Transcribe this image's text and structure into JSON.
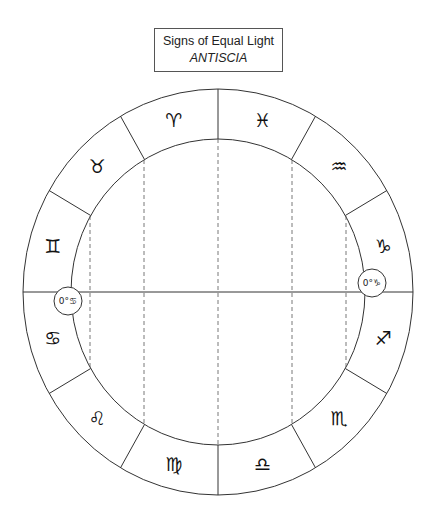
{
  "title": {
    "main": "Signs of Equal Light",
    "sub": "ANTISCIA"
  },
  "wheel": {
    "center": [
      218,
      292
    ],
    "outer_radius": [
      195,
      203
    ],
    "inner_radius": [
      147,
      153
    ],
    "signs": [
      {
        "name": "aries",
        "glyph": "♈︎",
        "angle": 105
      },
      {
        "name": "pisces",
        "glyph": "♓︎",
        "angle": 75
      },
      {
        "name": "aquarius",
        "glyph": "♒︎",
        "angle": 45
      },
      {
        "name": "capricorn",
        "glyph": "♑︎",
        "angle": 15
      },
      {
        "name": "sagittarius",
        "glyph": "♐︎",
        "angle": -15
      },
      {
        "name": "scorpio",
        "glyph": "♏︎",
        "angle": -45
      },
      {
        "name": "libra",
        "glyph": "♎︎",
        "angle": -75
      },
      {
        "name": "virgo",
        "glyph": "♍︎",
        "angle": -105
      },
      {
        "name": "leo",
        "glyph": "♌︎",
        "angle": -135
      },
      {
        "name": "cancer",
        "glyph": "♋︎",
        "angle": -165
      },
      {
        "name": "gemini",
        "glyph": "♊︎",
        "angle": 165
      },
      {
        "name": "taurus",
        "glyph": "♉︎",
        "angle": 135
      }
    ],
    "markers": [
      {
        "name": "cancer-0-marker",
        "label": "0°♋︎",
        "cx": 68,
        "cy": 301
      },
      {
        "name": "capricorn-0-marker",
        "label": "0°♑︎",
        "cx": 372,
        "cy": 283
      }
    ]
  },
  "colors": {
    "line": "#333333",
    "dashed": "#555555",
    "glyph": "#111111"
  }
}
